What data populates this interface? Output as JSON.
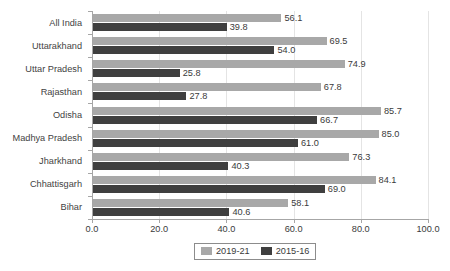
{
  "chart_data": {
    "type": "bar",
    "orientation": "horizontal",
    "title": "",
    "xlabel": "",
    "ylabel": "",
    "xlim": [
      0.0,
      100.0
    ],
    "xticks": [
      "0.0",
      "20.0",
      "40.0",
      "60.0",
      "80.0",
      "100.0"
    ],
    "grid": true,
    "legend_position": "bottom",
    "categories": [
      "All India",
      "Uttarakhand",
      "Uttar Pradesh",
      "Rajasthan",
      "Odisha",
      "Madhya Pradesh",
      "Jharkhand",
      "Chhattisgarh",
      "Bihar"
    ],
    "series": [
      {
        "name": "2019-21",
        "color": "#a8a8a8",
        "values": [
          56.1,
          69.5,
          74.9,
          67.8,
          85.7,
          85.0,
          76.3,
          84.1,
          58.1
        ],
        "labels": [
          "56.1",
          "69.5",
          "74.9",
          "67.8",
          "85.7",
          "85.0",
          "76.3",
          "84.1",
          "58.1"
        ]
      },
      {
        "name": "2015-16",
        "color": "#3f3f3f",
        "values": [
          39.8,
          54.0,
          25.8,
          27.8,
          66.7,
          61.0,
          40.3,
          69.0,
          40.6
        ],
        "labels": [
          "39.8",
          "54.0",
          "25.8",
          "27.8",
          "66.7",
          "61.0",
          "40.3",
          "69.0",
          "40.6"
        ]
      }
    ]
  }
}
